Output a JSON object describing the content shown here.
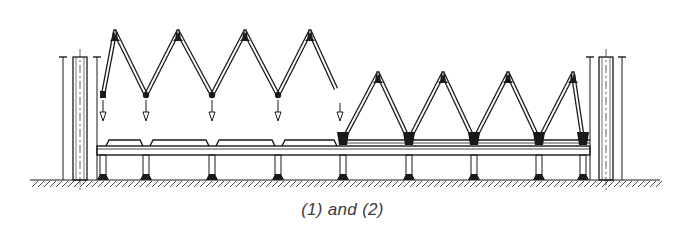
{
  "caption": "(1) and (2)",
  "colors": {
    "ink": "#1a1a1a",
    "background": "#ffffff",
    "caption": "#3a3a3a"
  },
  "ground_y": 180,
  "columns": [
    {
      "name": "left-column",
      "x_center": 80,
      "top": 57,
      "flange_left": 63,
      "flange_right": 97
    },
    {
      "name": "right-column",
      "x_center": 606,
      "top": 57,
      "flange_left": 590,
      "flange_right": 622
    }
  ],
  "beam": {
    "x_start": 97,
    "x_end": 590,
    "top": 146,
    "bottom": 155
  },
  "folded_truss": {
    "description": "Truss being lowered (folded, suspended above)",
    "apexes_x": [
      115,
      178,
      245,
      310
    ],
    "apex_y": 32,
    "valleys_x": [
      103,
      146,
      212,
      278,
      340
    ],
    "valley_y": 95,
    "arrows_x": [
      103,
      146,
      212,
      278,
      340
    ]
  },
  "placed_truss": {
    "description": "Truss seated on beam",
    "apexes_x": [
      378,
      443,
      508,
      573
    ],
    "apex_y": 74,
    "supports_x": [
      343,
      409,
      474,
      539,
      583
    ],
    "support_y": 140
  },
  "posts_x": [
    103,
    146,
    212,
    278,
    343,
    409,
    474,
    539,
    583
  ],
  "pads": [
    {
      "x1": 106,
      "x2": 143
    },
    {
      "x1": 150,
      "x2": 209
    },
    {
      "x1": 216,
      "x2": 275
    },
    {
      "x1": 282,
      "x2": 337
    }
  ]
}
